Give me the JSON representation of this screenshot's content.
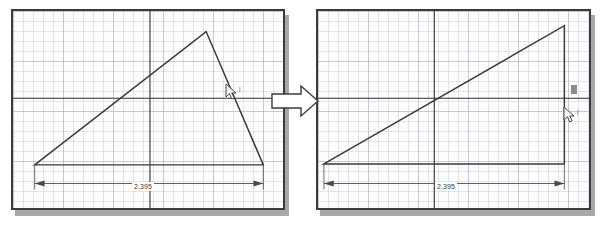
{
  "screen": {
    "width": 611,
    "height": 226,
    "background_color": "#ffffff",
    "caption": ""
  },
  "colors": {
    "panel_background": "#fdfdfd",
    "panel_border": "#3b3b3b",
    "panel_shadow": "#a8a8a8",
    "grid_minor": "#cbd2dc",
    "grid_major": "#a8b0be",
    "geometry_line": "#3a3a3a",
    "axis_line": "#2f2f2f",
    "dimension_line": "#4a4a4a",
    "arrow_fill": "#ffffff",
    "arrow_stroke": "#3b3b3b",
    "text": "#3a3a3a"
  },
  "left_panel": {
    "name": "before-sketch-viewport",
    "title": "",
    "dimension": {
      "label": "2.395",
      "units": "",
      "orientation": "horizontal"
    },
    "shape": {
      "type": "triangle",
      "description": "scalene triangle",
      "vertices": [
        {
          "x": 33,
          "y": 166
        },
        {
          "x": 207,
          "y": 30
        },
        {
          "x": 265,
          "y": 166
        }
      ]
    },
    "axis": {
      "horizontal_y": 98,
      "vertical_x": 150
    },
    "cursor": {
      "name": "mouse-pointer",
      "x": 228,
      "y": 87
    },
    "cursor_tag": "|"
  },
  "right_panel": {
    "name": "after-sketch-viewport",
    "title": "",
    "dimension": {
      "label": "2.395",
      "units": "",
      "orientation": "horizontal"
    },
    "shape": {
      "type": "right-triangle",
      "description": "right triangle after vertical constraint applied",
      "vertices": [
        {
          "x": 322,
          "y": 165
        },
        {
          "x": 566,
          "y": 24
        },
        {
          "x": 566,
          "y": 165
        }
      ]
    },
    "axis": {
      "horizontal_y": 98,
      "vertical_x": 434
    },
    "cursor": {
      "name": "mouse-pointer",
      "x": 566,
      "y": 110
    },
    "cursor_tag": "|",
    "constraint_marker": {
      "name": "vertical-constraint-glyph",
      "label": "",
      "x": 571,
      "y": 86
    }
  },
  "transition_arrow": {
    "name": "transition-arrow",
    "direction": "right",
    "label": ""
  }
}
